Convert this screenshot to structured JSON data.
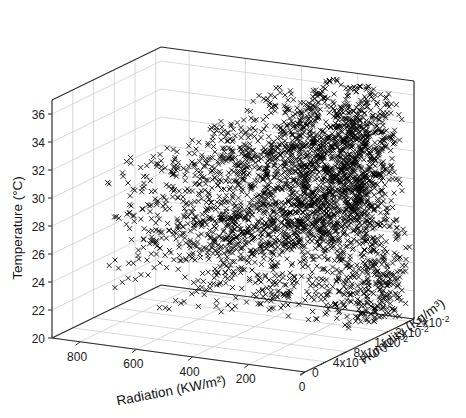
{
  "figure": {
    "background_color": "#ffffff",
    "marker_symbol": "x",
    "marker_color": "#000000",
    "grid_color": "#c8c8c8",
    "axis_color": "#2b2b2b"
  },
  "chart_data": {
    "type": "scatter",
    "projection": "3d",
    "title": "",
    "subtitle": "",
    "grid": true,
    "legend": null,
    "marker": "x",
    "marker_color": "#000000",
    "xlabel": "Radiation (KW/m²)",
    "ylabel": "Temperature (°C)",
    "zlabel": "Humidity (Kg/m³)",
    "xticklabels": [
      "800",
      "600",
      "400",
      "200",
      "0"
    ],
    "xtickvalues": [
      800,
      600,
      400,
      200,
      0
    ],
    "xlim": [
      900,
      0
    ],
    "x_axis_direction": "descending-left-to-right",
    "yticklabels": [
      "20",
      "22",
      "24",
      "26",
      "28",
      "30",
      "32",
      "34",
      "36"
    ],
    "ytickvalues": [
      20,
      22,
      24,
      26,
      28,
      30,
      32,
      34,
      36
    ],
    "ylim": [
      20,
      37
    ],
    "zticklabels": [
      "0",
      "4x10-3",
      "8x10-3",
      "1x10-2",
      "2x10-2",
      "2x10-2"
    ],
    "ztickvalues": [
      0,
      0.004,
      0.008,
      0.012,
      0.016,
      0.02
    ],
    "zlim": [
      0,
      0.021
    ],
    "ztick_superscripts": [
      {
        "mantissa": "0",
        "times": "",
        "base": "",
        "exp": ""
      },
      {
        "mantissa": "4",
        "times": "x",
        "base": "10",
        "exp": "-3"
      },
      {
        "mantissa": "8",
        "times": "x",
        "base": "10",
        "exp": "-3"
      },
      {
        "mantissa": "1",
        "times": "x",
        "base": "10",
        "exp": "-2"
      },
      {
        "mantissa": "2",
        "times": "x",
        "base": "10",
        "exp": "-2"
      },
      {
        "mantissa": "2",
        "times": "x",
        "base": "10",
        "exp": "-2"
      }
    ],
    "n_points_approx": 2100
  },
  "axes": {
    "x": {
      "label": "Radiation (KW/m²)",
      "ticks": [
        "800",
        "600",
        "400",
        "200",
        "0"
      ]
    },
    "y": {
      "label": "Temperature (°C)",
      "ticks": [
        "20",
        "22",
        "24",
        "26",
        "28",
        "30",
        "32",
        "34",
        "36"
      ]
    },
    "z": {
      "label": "Humidity (Kg/m³)",
      "ticks": [
        "0",
        "4x10-3",
        "8x10-3",
        "1x10-2",
        "2x10-2",
        "2x10-2"
      ]
    }
  }
}
